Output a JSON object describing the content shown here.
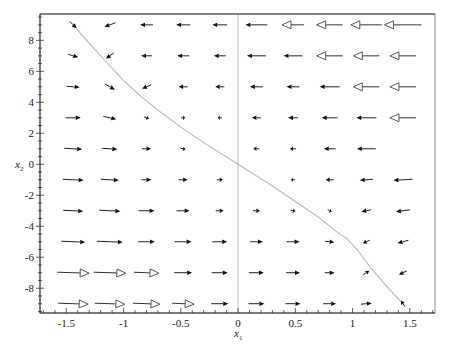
{
  "chart_data": {
    "type": "vector-field",
    "title": "",
    "xlabel": "x1",
    "ylabel": "x2",
    "xlim": [
      -1.73,
      1.72
    ],
    "ylim": [
      -9.6,
      9.7
    ],
    "grid": false,
    "x_ticks": [
      -1.5,
      -1,
      -0.5,
      0,
      0.5,
      1,
      1.5
    ],
    "x_tick_labels": [
      "-1.5",
      "-1",
      "-0.5",
      "0",
      "0.5",
      "1",
      "1.5"
    ],
    "y_ticks": [
      8,
      6,
      4,
      2,
      0,
      -2,
      -4,
      -6,
      -8
    ],
    "y_tick_labels": [
      "8",
      "6",
      "4",
      "2",
      "0",
      "-2",
      "-4",
      "-6",
      "-8"
    ],
    "grid_x": [
      -1.44,
      -1.12,
      -0.8,
      -0.48,
      -0.16,
      0.16,
      0.48,
      0.8,
      1.12,
      1.44
    ],
    "grid_y": [
      9,
      7,
      5,
      3,
      1,
      -1,
      -3,
      -5,
      -7,
      -9
    ],
    "arrows_px_note": "each row lists [dx, dy] in screen pixels per column (left to right); dy positive = downward; null = no arrow drawn; style 'h' = hollow triangular head",
    "arrows": [
      [
        [
          7,
          7,
          "f"
        ],
        [
          -11,
          4,
          "f"
        ],
        [
          -13,
          0,
          "f"
        ],
        [
          -14,
          0,
          "f"
        ],
        [
          -15,
          0,
          "f"
        ],
        [
          -22,
          0,
          "f"
        ],
        [
          -22,
          0,
          "h"
        ],
        [
          -26,
          0,
          "h"
        ],
        [
          -31,
          0,
          "h"
        ],
        [
          -37,
          0,
          "h"
        ]
      ],
      [
        [
          10,
          3,
          "f"
        ],
        [
          -8,
          6,
          "f"
        ],
        [
          -11,
          0,
          "f"
        ],
        [
          -12,
          0,
          "f"
        ],
        [
          -12,
          0,
          "f"
        ],
        [
          -19,
          0,
          "f"
        ],
        [
          -19,
          0,
          "f"
        ],
        [
          -26,
          0,
          "h"
        ],
        [
          -26,
          0,
          "h"
        ],
        [
          -26,
          0,
          "h"
        ]
      ],
      [
        [
          13,
          1,
          "f"
        ],
        [
          10,
          6,
          "f"
        ],
        [
          -9,
          4,
          "f"
        ],
        [
          -9,
          0,
          "f"
        ],
        [
          -9,
          0,
          "f"
        ],
        [
          -13,
          0,
          "f"
        ],
        [
          -13,
          0,
          "f"
        ],
        [
          -20,
          0,
          "f"
        ],
        [
          -26,
          0,
          "h"
        ],
        [
          -26,
          0,
          "h"
        ]
      ],
      [
        [
          15,
          0,
          "f"
        ],
        [
          13,
          3,
          "f"
        ],
        [
          5,
          2,
          "f"
        ],
        [
          4,
          0,
          "f"
        ],
        [
          -4,
          0,
          "f"
        ],
        [
          -9,
          0,
          "f"
        ],
        [
          -10,
          0,
          "f"
        ],
        [
          -16,
          0,
          "f"
        ],
        [
          -20,
          0,
          "f"
        ],
        [
          -26,
          0,
          "h"
        ]
      ],
      [
        [
          18,
          1,
          "f"
        ],
        [
          15,
          1,
          "f"
        ],
        [
          9,
          0,
          "f"
        ],
        [
          5,
          1,
          "f"
        ],
        null,
        [
          -6,
          0,
          "f"
        ],
        [
          -6,
          0,
          "f"
        ],
        [
          -12,
          0,
          "f"
        ],
        [
          -19,
          0,
          "f"
        ],
        null
      ],
      [
        [
          21,
          1,
          "f"
        ],
        [
          18,
          1,
          "f"
        ],
        [
          10,
          0,
          "f"
        ],
        [
          9,
          0,
          "f"
        ],
        [
          6,
          0,
          "f"
        ],
        null,
        [
          -4,
          0,
          "f"
        ],
        [
          -8,
          0,
          "f"
        ],
        [
          -13,
          1,
          "f"
        ],
        [
          -19,
          1,
          "f"
        ]
      ],
      [
        [
          20,
          1,
          "f"
        ],
        [
          21,
          1,
          "f"
        ],
        [
          16,
          0,
          "f"
        ],
        [
          13,
          0,
          "f"
        ],
        [
          8,
          0,
          "f"
        ],
        [
          7,
          0,
          "f"
        ],
        [
          5,
          1,
          "f"
        ],
        [
          4,
          2,
          "f"
        ],
        [
          -10,
          2,
          "f"
        ],
        [
          -14,
          2,
          "f"
        ]
      ],
      [
        [
          24,
          1,
          "f"
        ],
        [
          26,
          1,
          "f"
        ],
        [
          17,
          0,
          "f"
        ],
        [
          17,
          0,
          "f"
        ],
        [
          15,
          0,
          "f"
        ],
        [
          13,
          0,
          "f"
        ],
        [
          13,
          0,
          "f"
        ],
        [
          9,
          1,
          "f"
        ],
        [
          -7,
          3,
          "f"
        ],
        [
          -11,
          3,
          "f"
        ]
      ],
      [
        [
          32,
          1,
          "h"
        ],
        [
          32,
          1,
          "h"
        ],
        [
          25,
          1,
          "h"
        ],
        [
          18,
          0,
          "f"
        ],
        [
          16,
          0,
          "f"
        ],
        [
          15,
          0,
          "f"
        ],
        [
          14,
          0,
          "f"
        ],
        [
          10,
          0,
          "f"
        ],
        [
          6,
          -4,
          "f"
        ],
        [
          -8,
          4,
          "f"
        ]
      ],
      [
        [
          30,
          1,
          "h"
        ],
        [
          30,
          1,
          "h"
        ],
        [
          27,
          1,
          "h"
        ],
        [
          22,
          1,
          "h"
        ],
        [
          17,
          0,
          "f"
        ],
        [
          16,
          0,
          "f"
        ],
        [
          15,
          0,
          "f"
        ],
        [
          13,
          0,
          "f"
        ],
        [
          11,
          -1,
          "f"
        ],
        [
          -4,
          -6,
          "f"
        ]
      ]
    ],
    "curve": {
      "description": "sliding surface / trajectory curve",
      "color": "#b5b5b5",
      "points": [
        [
          -1.44,
          9.0
        ],
        [
          -1.3,
          7.8
        ],
        [
          -1.15,
          6.6
        ],
        [
          -1.0,
          5.4
        ],
        [
          -0.85,
          4.4
        ],
        [
          -0.7,
          3.5
        ],
        [
          -0.5,
          2.4
        ],
        [
          -0.3,
          1.4
        ],
        [
          -0.15,
          0.7
        ],
        [
          0,
          0
        ],
        [
          0.15,
          -0.7
        ],
        [
          0.3,
          -1.4
        ],
        [
          0.5,
          -2.4
        ],
        [
          0.7,
          -3.4
        ],
        [
          0.85,
          -4.3
        ],
        [
          0.95,
          -4.8
        ],
        [
          1.05,
          -5.6
        ],
        [
          1.15,
          -6.6
        ],
        [
          1.3,
          -7.9
        ],
        [
          1.44,
          -9.0
        ]
      ]
    },
    "zero_line_x": 0,
    "colors": {
      "arrow": "#111111",
      "frame": "#555555",
      "curve": "#b5b5b5",
      "zero_line": "#bdbdbd"
    }
  },
  "axes": {
    "xlabel_main": "x",
    "xlabel_sub": "1",
    "ylabel_main": "x",
    "ylabel_sub": "2"
  }
}
